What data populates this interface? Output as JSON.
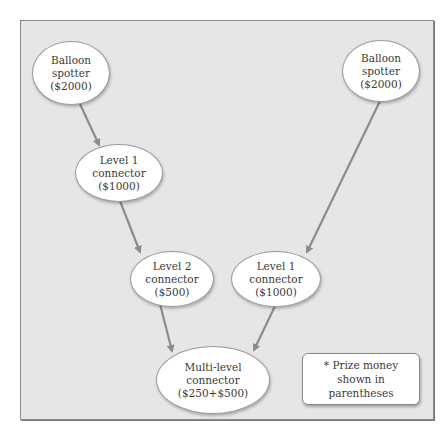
{
  "diagram": {
    "nodes": [
      {
        "id": "balloon_spotter_left",
        "lines": [
          "Balloon",
          "spotter",
          "($2000)"
        ]
      },
      {
        "id": "level1_connector_left",
        "lines": [
          "Level 1",
          "connector",
          "($1000)"
        ]
      },
      {
        "id": "level2_connector",
        "lines": [
          "Level 2",
          "connector",
          "($500)"
        ]
      },
      {
        "id": "balloon_spotter_right",
        "lines": [
          "Balloon",
          "spotter",
          "($2000)"
        ]
      },
      {
        "id": "level1_connector_right",
        "lines": [
          "Level 1",
          "connector",
          "($1000)"
        ]
      },
      {
        "id": "multi_level_connector",
        "lines": [
          "Multi-level",
          "connector",
          "($250+$500)"
        ]
      }
    ],
    "edges": [
      {
        "from": "balloon_spotter_left",
        "to": "level1_connector_left"
      },
      {
        "from": "level1_connector_left",
        "to": "level2_connector"
      },
      {
        "from": "level2_connector",
        "to": "multi_level_connector"
      },
      {
        "from": "balloon_spotter_right",
        "to": "level1_connector_right"
      },
      {
        "from": "level1_connector_right",
        "to": "multi_level_connector"
      }
    ],
    "note": "* Prize money shown in parentheses",
    "colors": {
      "background": "#e6e6e6",
      "node_fill": "#ffffff",
      "edge": "#8c8c8c",
      "text": "#3a3a3a"
    }
  }
}
